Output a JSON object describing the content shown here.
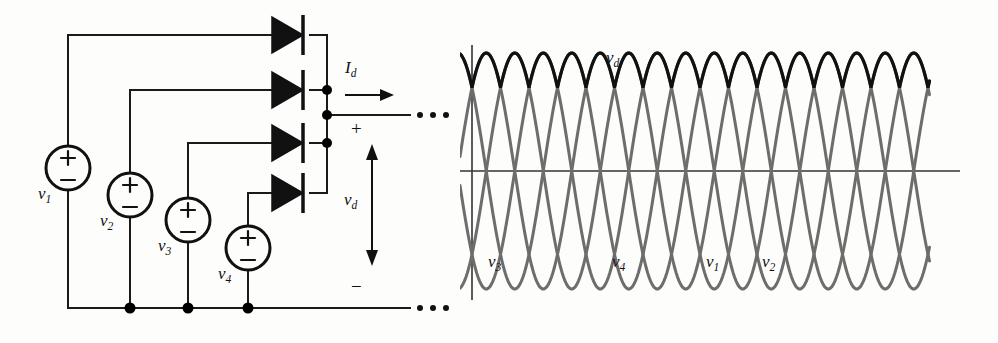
{
  "figure": {
    "type": "multiphase-rectifier-figure",
    "panels": [
      "circuit-schematic",
      "waveform-plot"
    ]
  },
  "circuit": {
    "sources": [
      {
        "id": "v1",
        "label": "v",
        "sub": "1",
        "plus": "+",
        "minus": "−",
        "cx": 68,
        "cy": 168,
        "r": 22,
        "label_x": 43,
        "label_y": 196
      },
      {
        "id": "v2",
        "label": "v",
        "sub": "2",
        "plus": "+",
        "minus": "−",
        "cx": 130,
        "cy": 195,
        "r": 22,
        "label_x": 105,
        "label_y": 223
      },
      {
        "id": "v3",
        "label": "v",
        "sub": "3",
        "plus": "+",
        "minus": "−",
        "cx": 188,
        "cy": 220,
        "r": 22,
        "label_x": 163,
        "label_y": 248
      },
      {
        "id": "v4",
        "label": "v",
        "sub": "4",
        "plus": "+",
        "minus": "−",
        "cx": 248,
        "cy": 248,
        "r": 22,
        "label_x": 223,
        "label_y": 276
      }
    ],
    "diodes": [
      {
        "id": "d1",
        "y": 35,
        "x": 272
      },
      {
        "id": "d2",
        "y": 90,
        "x": 272
      },
      {
        "id": "d3",
        "y": 143,
        "x": 272
      },
      {
        "id": "d4",
        "y": 193,
        "x": 272
      }
    ],
    "bus_x": 327,
    "ground_y": 308,
    "nodes": [
      {
        "x": 327,
        "y": 90
      },
      {
        "x": 327,
        "y": 115
      },
      {
        "x": 327,
        "y": 143
      },
      {
        "x": 130,
        "y": 308
      },
      {
        "x": 188,
        "y": 308
      },
      {
        "x": 248,
        "y": 308
      }
    ],
    "current_label": {
      "text": "I",
      "sub": "d",
      "x": 349,
      "y": 76
    },
    "voltage_label": {
      "text": "v",
      "sub": "d",
      "x": 349,
      "y": 208
    },
    "terminal_plus": {
      "text": "+",
      "x": 352,
      "y": 130
    },
    "terminal_minus": {
      "text": "−",
      "x": 352,
      "y": 288
    },
    "ellipsis_top": "· · ·",
    "ellipsis_bottom": "· · ·",
    "colors": {
      "wire": "#1a1a1a",
      "node": "#000000"
    }
  },
  "chart_data": {
    "type": "line",
    "title": "",
    "xlabel": "",
    "ylabel": "",
    "grid": false,
    "legend": "inline-annotations",
    "xlim": [
      0,
      4.4
    ],
    "ylim": [
      -1.25,
      1.25
    ],
    "axis_origin_x": 470,
    "axis_y0": 171,
    "series": [
      {
        "name": "v3",
        "color": "#6d6d6d",
        "phase_deg": 135,
        "amplitude": 1.0,
        "period": 1.0,
        "label_x": 493,
        "label_y": 266
      },
      {
        "name": "v4",
        "color": "#6d6d6d",
        "phase_deg": 45,
        "amplitude": 1.0,
        "period": 1.0,
        "label_x": 617,
        "label_y": 266
      },
      {
        "name": "v1",
        "color": "#6d6d6d",
        "phase_deg": -45,
        "amplitude": 1.0,
        "period": 1.0,
        "label_x": 710,
        "label_y": 266
      },
      {
        "name": "v2",
        "color": "#6d6d6d",
        "phase_deg": -135,
        "amplitude": 1.0,
        "period": 1.0,
        "label_x": 765,
        "label_y": 266
      },
      {
        "name": "vd",
        "color": "#111111",
        "envelope": "max",
        "label_x": 613,
        "label_y": 66
      }
    ],
    "annotations": [
      {
        "text": "v",
        "sub": "d",
        "x": 613,
        "y": 66
      },
      {
        "text": "v",
        "sub": "3",
        "x": 493,
        "y": 266
      },
      {
        "text": "v",
        "sub": "4",
        "x": 617,
        "y": 266
      },
      {
        "text": "v",
        "sub": "1",
        "x": 710,
        "y": 266
      },
      {
        "text": "v",
        "sub": "2",
        "x": 765,
        "y": 266
      }
    ],
    "colors": {
      "sine": "#6d6d6d",
      "envelope": "#111111",
      "axis": "#333333"
    }
  }
}
